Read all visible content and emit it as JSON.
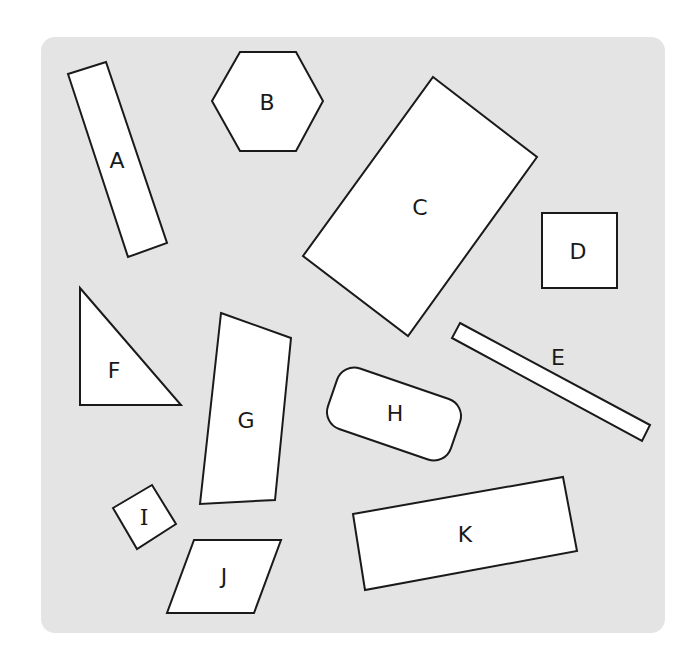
{
  "diagram": {
    "background": {
      "color": "#e4e4e4",
      "x": 41,
      "y": 37,
      "width": 624,
      "height": 596,
      "radius": 14
    },
    "shape_fill": "#ffffff",
    "stroke_color": "#1a1a1a",
    "shapes": [
      {
        "id": "A",
        "label": "A",
        "type": "rectangle",
        "points": "68,74 106,62 167,243 128,257",
        "label_x": 117,
        "label_y": 160
      },
      {
        "id": "B",
        "label": "B",
        "type": "hexagon",
        "points": "212,101 240,52 296,52 323,101 296,151 240,151",
        "label_x": 267,
        "label_y": 102
      },
      {
        "id": "C",
        "label": "C",
        "type": "rectangle",
        "points": "433,77 537,157 408,336 303,256",
        "label_x": 420,
        "label_y": 207
      },
      {
        "id": "D",
        "label": "D",
        "type": "square",
        "points": "542,213 617,213 617,288 542,288",
        "label_x": 578,
        "label_y": 251
      },
      {
        "id": "E",
        "label": "E",
        "type": "rectangle",
        "points": "460,323 650,425 642,441 452,338",
        "label_x": 558,
        "label_y": 357
      },
      {
        "id": "F",
        "label": "F",
        "type": "right-triangle",
        "points": "80,288 181,405 80,405",
        "label_x": 114,
        "label_y": 370
      },
      {
        "id": "G",
        "label": "G",
        "type": "quadrilateral",
        "points": "221,313 291,338 275,500 200,504",
        "label_x": 246,
        "label_y": 420
      },
      {
        "id": "H",
        "label": "H",
        "type": "rounded-rectangle",
        "cx": 394,
        "cy": 414,
        "width": 130,
        "height": 64,
        "rx": 18,
        "rotate": 19,
        "label_x": 395,
        "label_y": 413
      },
      {
        "id": "I",
        "label": "I",
        "type": "square",
        "points": "113,508 152,485 176,524 137,549",
        "label_x": 144,
        "label_y": 517
      },
      {
        "id": "J",
        "label": "J",
        "type": "parallelogram",
        "points": "194,540 281,540 254,613 167,613",
        "label_x": 224,
        "label_y": 576
      },
      {
        "id": "K",
        "label": "K",
        "type": "rectangle",
        "points": "353,514 563,477 577,551 365,590",
        "label_x": 465,
        "label_y": 534
      }
    ]
  }
}
